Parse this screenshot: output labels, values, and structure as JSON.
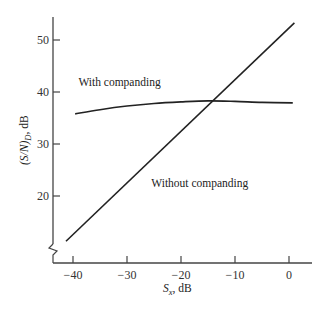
{
  "chart_data": {
    "type": "line",
    "title": "",
    "xlabel": "S_x, dB",
    "xlabel_main": "S",
    "xlabel_sub": "x",
    "xlabel_rest": ", dB",
    "ylabel": "(S/N)_D, dB",
    "ylabel_main": "(S/N)",
    "ylabel_sub": "D",
    "ylabel_rest": ", dB",
    "xlim": [
      -44,
      4
    ],
    "ylim": [
      8,
      55
    ],
    "x_ticks": [
      -40,
      -30,
      -20,
      -10,
      0
    ],
    "x_tick_labels": [
      "−40",
      "−30",
      "−20",
      "−10",
      "0"
    ],
    "y_ticks": [
      20,
      30,
      40,
      50
    ],
    "y_tick_labels": [
      "20",
      "30",
      "40",
      "50"
    ],
    "y_axis_break": true,
    "grid": false,
    "legend": "none",
    "series": [
      {
        "name": "With companding",
        "x": [
          -39.6,
          -35,
          -30,
          -25,
          -20,
          -15,
          -10,
          -5,
          0.7
        ],
        "y": [
          35.8,
          36.6,
          37.3,
          37.8,
          38.1,
          38.3,
          38.2,
          38.0,
          37.9
        ]
      },
      {
        "name": "Without companding",
        "x": [
          -41.3,
          1.0
        ],
        "y": [
          11.3,
          53.3
        ]
      }
    ],
    "annotations": [
      {
        "text": "With companding",
        "x": -39,
        "y": 41.2
      },
      {
        "text": "Without companding",
        "x": -25.5,
        "y": 21.8
      }
    ]
  }
}
